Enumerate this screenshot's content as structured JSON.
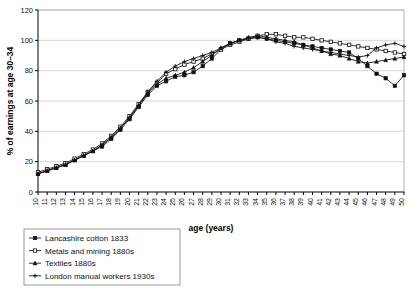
{
  "chart_data": {
    "type": "line",
    "title": "",
    "xlabel": "age (years)",
    "ylabel": "% of earnings at age 30–34",
    "xlim": [
      10,
      50
    ],
    "ylim": [
      0,
      120
    ],
    "yticks": [
      0,
      20,
      40,
      60,
      80,
      100,
      120
    ],
    "grid": true,
    "legend_position": "bottom-left",
    "x": [
      10,
      11,
      12,
      13,
      14,
      15,
      16,
      17,
      18,
      19,
      20,
      21,
      22,
      23,
      24,
      25,
      26,
      27,
      28,
      29,
      30,
      31,
      32,
      33,
      34,
      35,
      36,
      37,
      38,
      39,
      40,
      41,
      42,
      43,
      44,
      45,
      46,
      47,
      48,
      49,
      50
    ],
    "xticklabels": [
      "10",
      "11",
      "12",
      "13",
      "14",
      "15",
      "16",
      "17",
      "18",
      "19",
      "20",
      "21",
      "22",
      "23",
      "24",
      "25",
      "26",
      "27",
      "28",
      "29",
      "30",
      "31",
      "32",
      "33",
      "34",
      "35",
      "36",
      "37",
      "38",
      "39",
      "40",
      "41",
      "42",
      "43",
      "44",
      "45",
      "46",
      "47",
      "48",
      "49",
      "50"
    ],
    "series": [
      {
        "name": "Lancashire cotton 1833",
        "marker": "square-filled",
        "values": [
          12,
          14,
          16,
          18,
          21,
          24,
          27,
          30,
          35,
          41,
          48,
          56,
          64,
          70,
          73,
          76,
          77,
          79,
          83,
          88,
          94,
          98,
          100,
          101,
          102,
          101,
          100,
          99,
          98,
          97,
          96,
          95,
          94,
          93,
          92,
          88,
          83,
          78,
          75,
          70,
          77
        ]
      },
      {
        "name": "Metals and mining 1880s",
        "marker": "square-open",
        "values": [
          13,
          15,
          17,
          19,
          22,
          25,
          28,
          32,
          37,
          43,
          50,
          58,
          66,
          72,
          78,
          81,
          84,
          86,
          88,
          91,
          94,
          97,
          99,
          101,
          103,
          104,
          104,
          103,
          102,
          102,
          101,
          100,
          99,
          98,
          97,
          96,
          95,
          94,
          93,
          92,
          91
        ]
      },
      {
        "name": "Textiles 1880s",
        "marker": "triangle",
        "values": [
          12,
          14,
          16,
          18,
          21,
          24,
          27,
          31,
          36,
          42,
          49,
          57,
          65,
          71,
          75,
          77,
          79,
          82,
          86,
          90,
          95,
          98,
          100,
          102,
          103,
          102,
          101,
          100,
          99,
          97,
          95,
          93,
          91,
          90,
          88,
          86,
          85,
          86,
          87,
          88,
          89
        ]
      },
      {
        "name": "London manual workers 1930s",
        "marker": "plus",
        "values": [
          12,
          14,
          16,
          18,
          21,
          24,
          27,
          31,
          36,
          42,
          49,
          57,
          66,
          73,
          79,
          83,
          86,
          88,
          90,
          92,
          95,
          98,
          100,
          101,
          102,
          101,
          99,
          98,
          96,
          95,
          94,
          93,
          92,
          91,
          90,
          89,
          90,
          95,
          97,
          98,
          96
        ]
      }
    ]
  },
  "legend": {
    "items": [
      {
        "label": "Lancashire cotton 1833"
      },
      {
        "label": "Metals and mining 1880s"
      },
      {
        "label": "Textiles 1880s"
      },
      {
        "label": "London manual workers 1930s"
      }
    ]
  }
}
